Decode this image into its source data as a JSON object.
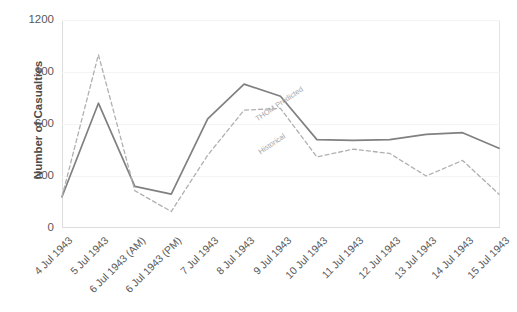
{
  "chart_data": {
    "type": "line",
    "title": "",
    "xlabel": "",
    "ylabel": "Number of Casualties",
    "ylim": [
      0,
      1200
    ],
    "yticks": [
      0,
      300,
      600,
      900,
      1200
    ],
    "grid": true,
    "legend_position": "inline-labels",
    "categories": [
      "4 Jul 1943",
      "5 Jul 1943",
      "6 Jul 1943 (AM)",
      "6 Jul 1943 (PM)",
      "7 Jul 1943",
      "8 Jul 1943",
      "9 Jul 1943",
      "10 Jul 1943",
      "11 Jul 1943",
      "12 Jul 1943",
      "13 Jul 1943",
      "14 Jul 1943",
      "15 Jul 1943"
    ],
    "series": [
      {
        "name": "THOM Predicted",
        "style": "solid",
        "color": "#808080",
        "values": [
          180,
          720,
          240,
          195,
          630,
          830,
          760,
          510,
          505,
          510,
          540,
          550,
          460
        ]
      },
      {
        "name": "Historical",
        "style": "dashed",
        "color": "#b0b0b0",
        "values": [
          180,
          1000,
          215,
          95,
          420,
          680,
          690,
          410,
          455,
          430,
          300,
          390,
          195
        ]
      }
    ],
    "annotations": [
      {
        "text": "THOM Predicted",
        "series": "THOM Predicted"
      },
      {
        "text": "Historical",
        "series": "Historical"
      }
    ]
  },
  "axis": {
    "y_tick_labels": [
      "1200",
      "900",
      "600",
      "300",
      "0"
    ],
    "y_title": "Number of Casualties"
  },
  "colors": {
    "solid_line": "#808080",
    "dashed_line": "#b0b0b0",
    "gridline": "#f4f4f4",
    "axis_text": "#595959",
    "plot_border": "#e4e4e4",
    "background": "#ffffff"
  }
}
